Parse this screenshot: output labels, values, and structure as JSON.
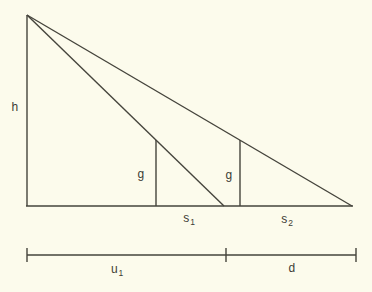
{
  "figure": {
    "background_color": "#fcfbec",
    "line_color": "#45443c",
    "text_color": "#3d3c35",
    "labels": {
      "h": {
        "base": "h"
      },
      "g1": {
        "base": "g"
      },
      "g2": {
        "base": "g"
      },
      "s1": {
        "base": "s",
        "sub": "1"
      },
      "s2": {
        "base": "s",
        "sub": "2"
      },
      "u1": {
        "base": "u",
        "sub": "1"
      },
      "d": {
        "base": "d"
      }
    },
    "lines": [
      {
        "name": "triangle-left-side",
        "x1": 27,
        "y1": 15,
        "x2": 27,
        "y2": 206
      },
      {
        "name": "triangle-base",
        "x1": 26,
        "y1": 206,
        "x2": 353,
        "y2": 206
      },
      {
        "name": "hypotenuse-inner",
        "x1": 27,
        "y1": 15,
        "x2": 224,
        "y2": 206
      },
      {
        "name": "hypotenuse-outer",
        "x1": 27,
        "y1": 15,
        "x2": 352,
        "y2": 206
      },
      {
        "name": "gnomon-1-line",
        "x1": 156,
        "y1": 140,
        "x2": 156,
        "y2": 206
      },
      {
        "name": "gnomon-2-line",
        "x1": 240,
        "y1": 140,
        "x2": 240,
        "y2": 206
      },
      {
        "name": "measure-line",
        "x1": 27,
        "y1": 255,
        "x2": 356,
        "y2": 255
      },
      {
        "name": "measure-tick-left",
        "x1": 27,
        "y1": 248,
        "x2": 27,
        "y2": 262
      },
      {
        "name": "measure-tick-middle",
        "x1": 226,
        "y1": 248,
        "x2": 226,
        "y2": 262
      },
      {
        "name": "measure-tick-right",
        "x1": 356,
        "y1": 248,
        "x2": 356,
        "y2": 262
      }
    ]
  }
}
